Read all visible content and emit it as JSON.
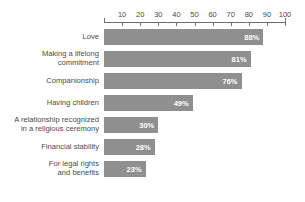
{
  "chart_data": {
    "type": "bar",
    "orientation": "horizontal",
    "title": "",
    "subtitle": "",
    "xlabel": "",
    "ylabel": "",
    "xlim": [
      0,
      100
    ],
    "grid": false,
    "legend": null,
    "axis_position": "top",
    "tick_labels": [
      "10",
      "20",
      "30",
      "40",
      "50",
      "60",
      "70",
      "80",
      "90",
      "100"
    ],
    "tick_values": [
      10,
      20,
      30,
      40,
      50,
      60,
      70,
      80,
      90,
      100
    ],
    "categories": [
      "Love",
      "Making a lifelong commitment",
      "Companionship",
      "Having children",
      "A relationship recognized in a religious ceremony",
      "Financial stability",
      "For legal rights and benefits"
    ],
    "values": [
      88,
      81,
      76,
      49,
      30,
      28,
      23
    ],
    "value_labels": [
      "88%",
      "81%",
      "76%",
      "49%",
      "30%",
      "28%",
      "23%"
    ],
    "bar_color": "#8f8f8f",
    "value_label_color": "#ffffff",
    "text_color": "#4a4a4a"
  },
  "rows": [
    {
      "label_line1": "Love",
      "label_line2": "",
      "value": 88,
      "value_label": "88%"
    },
    {
      "label_line1": "Making a lifelong",
      "label_line2": "commitment",
      "value": 81,
      "value_label": "81%"
    },
    {
      "label_line1": "Companionship",
      "label_line2": "",
      "value": 76,
      "value_label": "76%"
    },
    {
      "label_line1": "Having children",
      "label_line2": "",
      "value": 49,
      "value_label": "49%"
    },
    {
      "label_line1": "A relationship recognized",
      "label_line2": "in a religious ceremony",
      "value": 30,
      "value_label": "30%"
    },
    {
      "label_line1": "Financial stability",
      "label_line2": "",
      "value": 28,
      "value_label": "28%"
    },
    {
      "label_line1": "For legal rights",
      "label_line2": "and benefits",
      "value": 23,
      "value_label": "23%"
    }
  ],
  "axis": {
    "ticks": [
      {
        "label": "10",
        "value": 10
      },
      {
        "label": "20",
        "value": 20
      },
      {
        "label": "30",
        "value": 30
      },
      {
        "label": "40",
        "value": 40
      },
      {
        "label": "50",
        "value": 50
      },
      {
        "label": "60",
        "value": 60
      },
      {
        "label": "70",
        "value": 70
      },
      {
        "label": "80",
        "value": 80
      },
      {
        "label": "90",
        "value": 90
      },
      {
        "label": "100",
        "value": 100
      }
    ],
    "max": 100
  }
}
